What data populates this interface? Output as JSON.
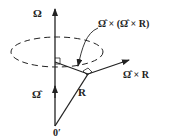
{
  "diagram": {
    "labels": {
      "omega": "Ω",
      "omega_hat": "Ω̂",
      "R": "R",
      "origin": "0′",
      "omega_hat_cross_R": "Ω̂ × R",
      "omega_hat_cross_omega_hat_cross_R": "Ω̂ × (Ω̂ × R)"
    },
    "colors": {
      "stroke": "#222222",
      "background": "#ffffff"
    }
  }
}
